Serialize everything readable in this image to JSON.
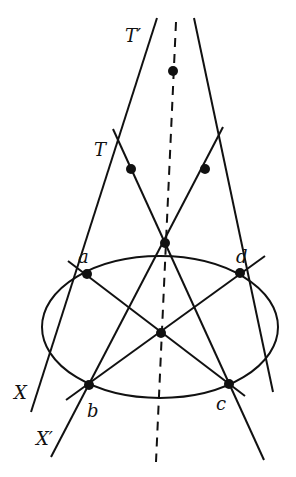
{
  "diagram": {
    "type": "projective-geometry",
    "labels": {
      "t_prime": "T′",
      "t": "T",
      "a": "a",
      "b": "b",
      "c": "c",
      "d": "d",
      "x": "X",
      "x_prime": "X′"
    },
    "points": {
      "T_prime": [
        173,
        71
      ],
      "T": [
        131,
        169
      ],
      "T_right": [
        205,
        169
      ],
      "top_mid": [
        165,
        243
      ],
      "a": [
        87,
        274
      ],
      "d": [
        240,
        273
      ],
      "center": [
        161,
        333
      ],
      "b": [
        89,
        385
      ],
      "c": [
        229,
        384
      ]
    },
    "ellipse": {
      "cx": 160,
      "cy": 327,
      "rx": 118,
      "ry": 71
    },
    "colors": {
      "ink": "#111111",
      "background": "#ffffff"
    }
  }
}
